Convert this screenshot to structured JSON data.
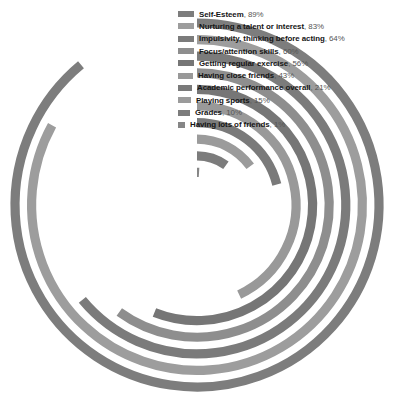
{
  "chart_data": {
    "type": "bar",
    "subtype": "radial-bar",
    "title": "",
    "subtitle": "",
    "xlabel": "",
    "ylabel": "",
    "units": "%",
    "value_range": [
      0,
      100
    ],
    "grid": false,
    "legend_position": "inside-top-right",
    "start_angle_deg": 0,
    "direction": "clockwise",
    "categories": [
      "Self-Esteem",
      "Nurturing a talent or interest",
      "Impulsivity, thinking before acting",
      "Focus/attention skills",
      "Getting regular exercise",
      "Having close friends",
      "Academic performance overall",
      "Playing sports",
      "Grades",
      "Having lots of friends"
    ],
    "values": [
      89,
      83,
      64,
      60,
      56,
      43,
      21,
      15,
      10,
      1
    ],
    "value_labels": [
      "89%",
      "83%",
      "64%",
      "60%",
      "56%",
      "43%",
      "21%",
      "15%",
      "10%",
      "1%"
    ],
    "colors": [
      "#7d7d7d",
      "#9d9d9d",
      "#7b7b7b",
      "#8e8e8e",
      "#767676",
      "#999999",
      "#7a7a7a",
      "#9b9b9b",
      "#7c7c7c",
      "#868686"
    ]
  },
  "legend": {
    "items": [
      {
        "label": "Self-Esteem",
        "value": "89%",
        "separator": ", ",
        "color": "#7d7d7d",
        "swatch_width": 16
      },
      {
        "label": "Nurturing a talent or interest",
        "value": "83%",
        "separator": ", ",
        "color": "#9d9d9d",
        "swatch_width": 16
      },
      {
        "label": "Impulsivity, thinking before acting",
        "value": "64%",
        "separator": ", ",
        "color": "#7b7b7b",
        "swatch_width": 16
      },
      {
        "label": "Focus/attention skills",
        "value": "60%",
        "separator": ", ",
        "color": "#8e8e8e",
        "swatch_width": 16
      },
      {
        "label": "Getting regular exercise",
        "value": "56%",
        "separator": ", ",
        "color": "#767676",
        "swatch_width": 16
      },
      {
        "label": "Having close friends",
        "value": "43%",
        "separator": ", ",
        "color": "#999999",
        "swatch_width": 15
      },
      {
        "label": "Academic performance overall",
        "value": "21%",
        "separator": ", ",
        "color": "#7a7a7a",
        "swatch_width": 14
      },
      {
        "label": "Playing sports",
        "value": "15%",
        "separator": ", ",
        "color": "#9b9b9b",
        "swatch_width": 13
      },
      {
        "label": "Grades",
        "value": "10%",
        "separator": ", ",
        "color": "#7c7c7c",
        "swatch_width": 12
      },
      {
        "label": "Having lots of friends",
        "value": "1%",
        "separator": ", ",
        "color": "#868686",
        "swatch_width": 7
      }
    ]
  },
  "geometry": {
    "center_x": 197,
    "center_y": 205,
    "outer_radius": 182,
    "radius_step": 16.6,
    "stroke_width": 9.2
  },
  "background_color": "#ffffff"
}
